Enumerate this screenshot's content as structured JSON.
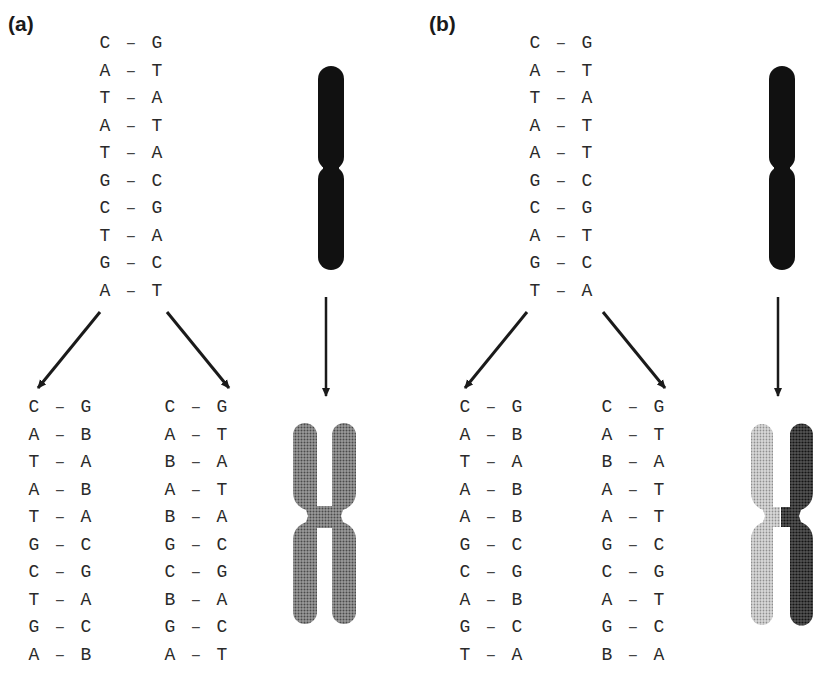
{
  "panels": [
    {
      "label": "(a)",
      "parent": [
        [
          "C",
          "G"
        ],
        [
          "A",
          "T"
        ],
        [
          "T",
          "A"
        ],
        [
          "A",
          "T"
        ],
        [
          "T",
          "A"
        ],
        [
          "G",
          "C"
        ],
        [
          "C",
          "G"
        ],
        [
          "T",
          "A"
        ],
        [
          "G",
          "C"
        ],
        [
          "A",
          "T"
        ]
      ],
      "daughter_left": [
        [
          "C",
          "G"
        ],
        [
          "A",
          "B"
        ],
        [
          "T",
          "A"
        ],
        [
          "A",
          "B"
        ],
        [
          "T",
          "A"
        ],
        [
          "G",
          "C"
        ],
        [
          "C",
          "G"
        ],
        [
          "T",
          "A"
        ],
        [
          "G",
          "C"
        ],
        [
          "A",
          "B"
        ]
      ],
      "daughter_right": [
        [
          "C",
          "G"
        ],
        [
          "A",
          "T"
        ],
        [
          "B",
          "A"
        ],
        [
          "A",
          "T"
        ],
        [
          "B",
          "A"
        ],
        [
          "G",
          "C"
        ],
        [
          "C",
          "G"
        ],
        [
          "B",
          "A"
        ],
        [
          "G",
          "C"
        ],
        [
          "A",
          "T"
        ]
      ],
      "chromosome_before": "single dark chromatid",
      "chromosome_after": "two sister chromatids, both medium-gray stippled"
    },
    {
      "label": "(b)",
      "parent": [
        [
          "C",
          "G"
        ],
        [
          "A",
          "T"
        ],
        [
          "T",
          "A"
        ],
        [
          "A",
          "T"
        ],
        [
          "A",
          "T"
        ],
        [
          "G",
          "C"
        ],
        [
          "C",
          "G"
        ],
        [
          "A",
          "T"
        ],
        [
          "G",
          "C"
        ],
        [
          "T",
          "A"
        ]
      ],
      "daughter_left": [
        [
          "C",
          "G"
        ],
        [
          "A",
          "B"
        ],
        [
          "T",
          "A"
        ],
        [
          "A",
          "B"
        ],
        [
          "A",
          "B"
        ],
        [
          "G",
          "C"
        ],
        [
          "C",
          "G"
        ],
        [
          "A",
          "B"
        ],
        [
          "G",
          "C"
        ],
        [
          "T",
          "A"
        ]
      ],
      "daughter_right": [
        [
          "C",
          "G"
        ],
        [
          "A",
          "T"
        ],
        [
          "B",
          "A"
        ],
        [
          "A",
          "T"
        ],
        [
          "A",
          "T"
        ],
        [
          "G",
          "C"
        ],
        [
          "C",
          "G"
        ],
        [
          "A",
          "T"
        ],
        [
          "G",
          "C"
        ],
        [
          "B",
          "A"
        ]
      ],
      "chromosome_before": "single dark chromatid",
      "chromosome_after": "two sister chromatids: left light-gray stippled, right dark stippled"
    }
  ],
  "bond_symbol": "–",
  "colors": {
    "text": "#2a2a2a",
    "arrow": "#1a1a1a",
    "chromosome_dark": "#111111",
    "chromatid_medium": "#7a7a7a",
    "chromatid_light": "#bdbdbd",
    "chromatid_darkstipple": "#2e2e2e"
  }
}
